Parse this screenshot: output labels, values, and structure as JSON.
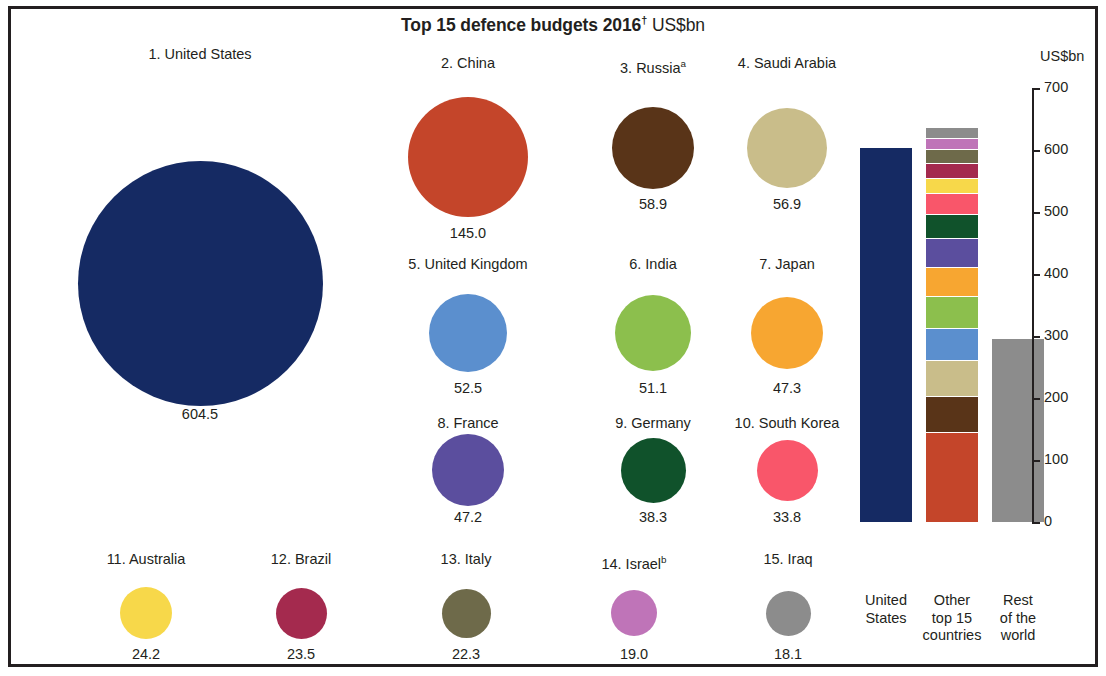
{
  "title": {
    "main": "Top 15 defence budgets 2016",
    "dagger": "†",
    "unit": "US$bn"
  },
  "axis": {
    "unit_label": "US$bn",
    "ticks": [
      "700",
      "600",
      "500",
      "400",
      "300",
      "200",
      "100",
      "0"
    ]
  },
  "bar_captions": {
    "us": "United\nStates",
    "other": "Other\ntop 15\ncountries",
    "rest": "Rest\nof the\nworld"
  },
  "chart_data": {
    "type": "bar",
    "title": "Top 15 defence budgets 2016† US$bn",
    "ylabel": "US$bn",
    "ylim": [
      0,
      700
    ],
    "ytick_values": [
      0,
      100,
      200,
      300,
      400,
      500,
      600,
      700
    ],
    "grid": false,
    "legend": "none",
    "bubbles": [
      {
        "rank": 1,
        "label": "1. United States",
        "country": "United States",
        "value": 604.5,
        "value_label": "604.5",
        "color": "#152a63",
        "note": ""
      },
      {
        "rank": 2,
        "label": "2. China",
        "country": "China",
        "value": 145.0,
        "value_label": "145.0",
        "color": "#c4452a",
        "note": ""
      },
      {
        "rank": 3,
        "label": "3. Russia",
        "country": "Russia",
        "value": 58.9,
        "value_label": "58.9",
        "color": "#593418",
        "note": "a"
      },
      {
        "rank": 4,
        "label": "4. Saudi Arabia",
        "country": "Saudi Arabia",
        "value": 56.9,
        "value_label": "56.9",
        "color": "#c9bd8a",
        "note": ""
      },
      {
        "rank": 5,
        "label": "5. United Kingdom",
        "country": "United Kingdom",
        "value": 52.5,
        "value_label": "52.5",
        "color": "#5b8fce",
        "note": ""
      },
      {
        "rank": 6,
        "label": "6. India",
        "country": "India",
        "value": 51.1,
        "value_label": "51.1",
        "color": "#8cbf4d",
        "note": ""
      },
      {
        "rank": 7,
        "label": "7. Japan",
        "country": "Japan",
        "value": 47.3,
        "value_label": "47.3",
        "color": "#f7a631",
        "note": ""
      },
      {
        "rank": 8,
        "label": "8. France",
        "country": "France",
        "value": 47.2,
        "value_label": "47.2",
        "color": "#5b4e9e",
        "note": ""
      },
      {
        "rank": 9,
        "label": "9. Germany",
        "country": "Germany",
        "value": 38.3,
        "value_label": "38.3",
        "color": "#10522b",
        "note": ""
      },
      {
        "rank": 10,
        "label": "10. South Korea",
        "country": "South Korea",
        "value": 33.8,
        "value_label": "33.8",
        "color": "#f9566a",
        "note": ""
      },
      {
        "rank": 11,
        "label": "11. Australia",
        "country": "Australia",
        "value": 24.2,
        "value_label": "24.2",
        "color": "#f7d84a",
        "note": ""
      },
      {
        "rank": 12,
        "label": "12. Brazil",
        "country": "Brazil",
        "value": 23.5,
        "value_label": "23.5",
        "color": "#a42a4e",
        "note": ""
      },
      {
        "rank": 13,
        "label": "13. Italy",
        "country": "Italy",
        "value": 22.3,
        "value_label": "22.3",
        "color": "#6e6a4a",
        "note": ""
      },
      {
        "rank": 14,
        "label": "14. Israel",
        "country": "Israel",
        "value": 19.0,
        "value_label": "19.0",
        "color": "#bf74b8",
        "note": "b"
      },
      {
        "rank": 15,
        "label": "15. Iraq",
        "country": "Iraq",
        "value": 18.1,
        "value_label": "18.1",
        "color": "#8c8c8c",
        "note": ""
      }
    ],
    "bars": [
      {
        "category": "United States",
        "total": 604.5,
        "segments": [
          {
            "name": "United States",
            "value": 604.5,
            "color": "#152a63"
          }
        ]
      },
      {
        "category": "Other top 15 countries",
        "total": 638.1,
        "segments": [
          {
            "name": "China",
            "value": 145.0,
            "color": "#c4452a"
          },
          {
            "name": "Russia",
            "value": 58.9,
            "color": "#593418"
          },
          {
            "name": "Saudi Arabia",
            "value": 56.9,
            "color": "#c9bd8a"
          },
          {
            "name": "United Kingdom",
            "value": 52.5,
            "color": "#5b8fce"
          },
          {
            "name": "India",
            "value": 51.1,
            "color": "#8cbf4d"
          },
          {
            "name": "Japan",
            "value": 47.3,
            "color": "#f7a631"
          },
          {
            "name": "France",
            "value": 47.2,
            "color": "#5b4e9e"
          },
          {
            "name": "Germany",
            "value": 38.3,
            "color": "#10522b"
          },
          {
            "name": "South Korea",
            "value": 33.8,
            "color": "#f9566a"
          },
          {
            "name": "Australia",
            "value": 24.2,
            "color": "#f7d84a"
          },
          {
            "name": "Brazil",
            "value": 23.5,
            "color": "#a42a4e"
          },
          {
            "name": "Italy",
            "value": 22.3,
            "color": "#6e6a4a"
          },
          {
            "name": "Israel",
            "value": 19.0,
            "color": "#bf74b8"
          },
          {
            "name": "Iraq",
            "value": 18.1,
            "color": "#8c8c8c"
          }
        ]
      },
      {
        "category": "Rest of the world",
        "total": 296.0,
        "segments": [
          {
            "name": "Rest of the world",
            "value": 296.0,
            "color": "#8c8c8c"
          }
        ]
      }
    ]
  },
  "layout": {
    "bubble_positions": [
      {
        "cx": 200,
        "cy": 283,
        "d": 245,
        "label_y": 46,
        "value_y": 406
      },
      {
        "cx": 468,
        "cy": 157,
        "d": 120,
        "label_y": 55,
        "value_y": 225
      },
      {
        "cx": 653,
        "cy": 148,
        "d": 82,
        "label_y": 55,
        "value_y": 196
      },
      {
        "cx": 787,
        "cy": 148,
        "d": 80,
        "label_y": 55,
        "value_y": 196
      },
      {
        "cx": 468,
        "cy": 333,
        "d": 78,
        "label_y": 256,
        "value_y": 380
      },
      {
        "cx": 653,
        "cy": 333,
        "d": 76,
        "label_y": 256,
        "value_y": 380
      },
      {
        "cx": 787,
        "cy": 333,
        "d": 72,
        "label_y": 256,
        "value_y": 380
      },
      {
        "cx": 468,
        "cy": 470,
        "d": 72,
        "label_y": 415,
        "value_y": 509
      },
      {
        "cx": 653,
        "cy": 470,
        "d": 65,
        "label_y": 415,
        "value_y": 509
      },
      {
        "cx": 787,
        "cy": 470,
        "d": 61,
        "label_y": 415,
        "value_y": 509
      },
      {
        "cx": 146,
        "cy": 613,
        "d": 52,
        "label_y": 551,
        "value_y": 646
      },
      {
        "cx": 301,
        "cy": 613,
        "d": 51,
        "label_y": 551,
        "value_y": 646
      },
      {
        "cx": 466,
        "cy": 613,
        "d": 49,
        "label_y": 551,
        "value_y": 646
      },
      {
        "cx": 634,
        "cy": 613,
        "d": 46,
        "label_y": 551,
        "value_y": 646
      },
      {
        "cx": 788,
        "cy": 613,
        "d": 45,
        "label_y": 551,
        "value_y": 646
      }
    ]
  }
}
